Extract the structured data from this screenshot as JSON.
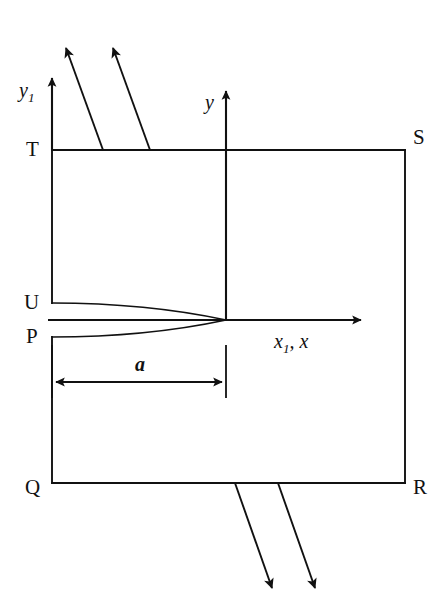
{
  "figure": {
    "kind": "technical-line-diagram",
    "background_color": "#ffffff",
    "line_color": "#111111"
  },
  "vertices": [
    {
      "id": "T",
      "label": "T",
      "position": "top-left"
    },
    {
      "id": "S",
      "label": "S",
      "position": "top-right"
    },
    {
      "id": "U",
      "label": "U",
      "position": "left-upper-mid"
    },
    {
      "id": "P",
      "label": "P",
      "position": "left-lower-mid"
    },
    {
      "id": "Q",
      "label": "Q",
      "position": "bottom-left"
    },
    {
      "id": "R",
      "label": "R",
      "position": "bottom-right"
    }
  ],
  "axes": [
    {
      "id": "y1",
      "label_html": "y<sub>1</sub>",
      "label_text": "y1",
      "orientation": "vertical",
      "origin": "left-edge"
    },
    {
      "id": "y",
      "label_html": "y",
      "label_text": "y",
      "orientation": "vertical",
      "origin": "center"
    },
    {
      "id": "x",
      "label_html": "x<sub>1</sub>, x",
      "label_text": "x1, x",
      "orientation": "horizontal",
      "origin": "center"
    }
  ],
  "dimensions": [
    {
      "id": "a",
      "label": "a",
      "from_vertex": "P-edge",
      "to_vertex": "y-axis",
      "style": "double-headed-arrow"
    }
  ],
  "flux_arrows": {
    "top_count": 2,
    "top_direction": "up-left",
    "bottom_count": 2,
    "bottom_direction": "down-right"
  },
  "curves": {
    "count": 2,
    "description": "Two curves from U and P converging to the origin on the x-axis",
    "shape": "cusp"
  }
}
